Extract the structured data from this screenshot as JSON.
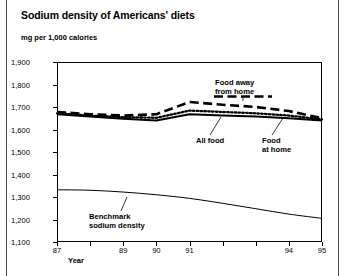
{
  "chart_data": {
    "type": "line",
    "title": "Sodium density of Americans' diets",
    "ylabel": "mg per 1,000 calories",
    "xlabel": "Year",
    "ylim": [
      1100,
      1900
    ],
    "y_ticks": [
      "1,900",
      "1,800",
      "1,700",
      "1,600",
      "1,500",
      "1,400",
      "1,300",
      "1,200",
      "1,100"
    ],
    "x_ticks": [
      "87",
      "",
      "89",
      "90",
      "91",
      "",
      "",
      "94",
      "95"
    ],
    "x_tick_labels_visible": [
      "87",
      "89",
      "90",
      "91",
      "94",
      "95"
    ],
    "x": [
      1987,
      1988,
      1989,
      1990,
      1991,
      1992,
      1993,
      1994,
      1995
    ],
    "grid": false,
    "legend": "inline-annotations",
    "series": [
      {
        "name": "Food away from home",
        "style": "dashed",
        "values": [
          1678,
          1668,
          1662,
          1668,
          1722,
          1710,
          1700,
          1682,
          1650
        ]
      },
      {
        "name": "All food",
        "style": "dotted",
        "values": [
          1672,
          1662,
          1655,
          1652,
          1684,
          1678,
          1672,
          1662,
          1645
        ]
      },
      {
        "name": "Food at home",
        "style": "solid",
        "values": [
          1668,
          1658,
          1648,
          1640,
          1668,
          1662,
          1658,
          1650,
          1640
        ]
      },
      {
        "name": "Benchmark sodium density",
        "style": "solid-thin",
        "values": [
          1332,
          1330,
          1322,
          1310,
          1294,
          1272,
          1248,
          1224,
          1205
        ]
      }
    ],
    "annotations": [
      {
        "id": "ann-away",
        "line1": "Food away",
        "line2": "from home"
      },
      {
        "id": "ann-all-food",
        "line1": "All food",
        "line2": ""
      },
      {
        "id": "ann-at-home",
        "line1": "Food",
        "line2": "at home"
      },
      {
        "id": "ann-benchmark",
        "line1": "Benchmark",
        "line2": "sodium density"
      }
    ]
  },
  "chart": {
    "title": "Sodium density of Americans' diets",
    "y_axis_label": "mg per 1,000 calories",
    "x_axis_label": "Year"
  },
  "y_ticks": [
    {
      "label": "1,900"
    },
    {
      "label": "1,800"
    },
    {
      "label": "1,700"
    },
    {
      "label": "1,600"
    },
    {
      "label": "1,500"
    },
    {
      "label": "1,400"
    },
    {
      "label": "1,300"
    },
    {
      "label": "1,200"
    },
    {
      "label": "1,100"
    }
  ],
  "x_ticks": [
    {
      "label": "87"
    },
    {
      "label": "89"
    },
    {
      "label": "90"
    },
    {
      "label": "91"
    },
    {
      "label": "94"
    },
    {
      "label": "95"
    }
  ],
  "annotations": {
    "food_away_l1": "Food away",
    "food_away_l2": "from home",
    "all_food": "All food",
    "food_at_home_l1": "Food",
    "food_at_home_l2": "at home",
    "benchmark_l1": "Benchmark",
    "benchmark_l2": "sodium density"
  }
}
